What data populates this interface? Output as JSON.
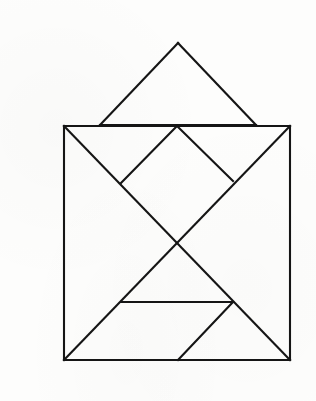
{
  "document": {
    "title": "Tangram Figure",
    "description": "Line drawing of a tangram puzzle: a square body subdivided into tangram pieces with a separate large triangle floating above it",
    "background_color": "#fdfdfc",
    "stroke_color": "#151515",
    "stroke_width": 2.1,
    "canvas": {
      "width": 316,
      "height": 401
    }
  },
  "figure_data": {
    "type": "diagram",
    "shape_name": "tangram",
    "piece_count": 8,
    "points": {
      "hat_apex": [
        178,
        43
      ],
      "hat_base_left": [
        100,
        125
      ],
      "hat_base_right": [
        256,
        125
      ],
      "square_tl": [
        64,
        126
      ],
      "square_tr": [
        290,
        126
      ],
      "square_br": [
        290,
        360
      ],
      "square_bl": [
        64,
        360
      ],
      "diamond_top": [
        177,
        126
      ],
      "diamond_left": [
        121,
        183
      ],
      "diamond_right": [
        233,
        181
      ],
      "center_cross": [
        176,
        242
      ],
      "mid_left": [
        121,
        302
      ],
      "mid_right": [
        233,
        302
      ],
      "bottom_mid": [
        178,
        360
      ]
    },
    "segments": [
      {
        "name": "hat-left-edge",
        "from": "hat_base_left",
        "to": "hat_apex"
      },
      {
        "name": "hat-right-edge",
        "from": "hat_apex",
        "to": "hat_base_right"
      },
      {
        "name": "hat-base",
        "from": "hat_base_left",
        "to": "hat_base_right"
      },
      {
        "name": "square-top-left-run",
        "from": "square_tl",
        "to": "diamond_top"
      },
      {
        "name": "square-top-right-run",
        "from": "diamond_top",
        "to": "square_tr"
      },
      {
        "name": "square-left-edge",
        "from": "square_tl",
        "to": "square_bl"
      },
      {
        "name": "square-right-edge",
        "from": "square_tr",
        "to": "square_br"
      },
      {
        "name": "square-bottom-edge",
        "from": "square_bl",
        "to": "square_br"
      },
      {
        "name": "diamond-upper-left",
        "from": "diamond_top",
        "to": "diamond_left"
      },
      {
        "name": "diamond-upper-right",
        "from": "diamond_top",
        "to": "diamond_right"
      },
      {
        "name": "diagonal-tl-to-br",
        "from": "square_tl",
        "to": "square_br"
      },
      {
        "name": "diagonal-tr-to-bl",
        "from": "square_tr",
        "to": "square_bl"
      },
      {
        "name": "mid-horizontal",
        "from": "mid_left",
        "to": "mid_right"
      },
      {
        "name": "lower-right-slant",
        "from": "mid_right",
        "to": "bottom_mid"
      }
    ],
    "pieces": [
      {
        "name": "large-triangle-hat",
        "vertices": [
          "hat_base_left",
          "hat_apex",
          "hat_base_right"
        ]
      },
      {
        "name": "triangle-upper-left",
        "vertices": [
          "square_tl",
          "diamond_top",
          "diamond_left"
        ]
      },
      {
        "name": "triangle-upper-right",
        "vertices": [
          "diamond_top",
          "square_tr",
          "diamond_right"
        ]
      },
      {
        "name": "triangle-center-left",
        "vertices": [
          "diamond_left",
          "diamond_top",
          "center_cross"
        ]
      },
      {
        "name": "triangle-center-right",
        "vertices": [
          "diamond_top",
          "diamond_right",
          "center_cross"
        ]
      },
      {
        "name": "triangle-left-large",
        "vertices": [
          "square_tl",
          "center_cross",
          "square_bl"
        ]
      },
      {
        "name": "triangle-right-large",
        "vertices": [
          "square_tr",
          "square_br",
          "center_cross"
        ]
      },
      {
        "name": "triangle-bottom-middle",
        "vertices": [
          "mid_left",
          "center_cross",
          "mid_right"
        ]
      },
      {
        "name": "parallelogram-bottom",
        "vertices": [
          "mid_left",
          "mid_right",
          "bottom_mid",
          "square_bl"
        ]
      },
      {
        "name": "triangle-bottom-right",
        "vertices": [
          "mid_right",
          "square_br",
          "bottom_mid"
        ]
      }
    ]
  }
}
